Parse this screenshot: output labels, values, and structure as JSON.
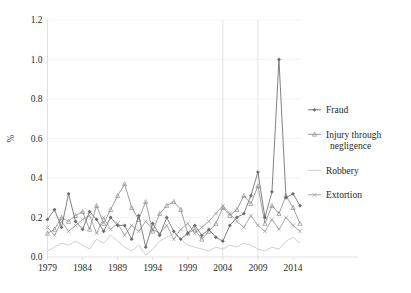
{
  "chart_data": {
    "type": "line",
    "title": "",
    "xlabel": "",
    "ylabel": "%",
    "xlim": [
      1979,
      2015
    ],
    "ylim": [
      0.0,
      1.2
    ],
    "grid": true,
    "grid_axis": "y-horizontal-faint-plus-two-vertical",
    "legend_position": "right",
    "y_ticks": [
      "0.0",
      "0.2",
      "0.4",
      "0.6",
      "0.8",
      "1.0",
      "1.2"
    ],
    "y_tick_values": [
      0.0,
      0.2,
      0.4,
      0.6,
      0.8,
      1.0,
      1.2
    ],
    "x_ticks": [
      "1979",
      "1984",
      "1989",
      "1994",
      "1999",
      "2004",
      "2009",
      "2014"
    ],
    "x_tick_values": [
      1979,
      1984,
      1989,
      1994,
      1999,
      2004,
      2009,
      2014
    ],
    "x": [
      1979,
      1980,
      1981,
      1982,
      1983,
      1984,
      1985,
      1986,
      1987,
      1988,
      1989,
      1990,
      1991,
      1992,
      1993,
      1994,
      1995,
      1996,
      1997,
      1998,
      1999,
      2000,
      2001,
      2002,
      2003,
      2004,
      2005,
      2006,
      2007,
      2008,
      2009,
      2010,
      2011,
      2012,
      2013,
      2014,
      2015
    ],
    "series": [
      {
        "name": "Fraud",
        "color": "#6b6b6b",
        "marker": "diamond",
        "values": [
          0.19,
          0.24,
          0.15,
          0.32,
          0.18,
          0.14,
          0.23,
          0.19,
          0.13,
          0.2,
          0.16,
          0.16,
          0.09,
          0.21,
          0.05,
          0.17,
          0.11,
          0.2,
          0.13,
          0.09,
          0.12,
          0.16,
          0.11,
          0.14,
          0.1,
          0.08,
          0.16,
          0.2,
          0.22,
          0.31,
          0.43,
          0.2,
          0.33,
          1.0,
          0.3,
          0.32,
          0.26
        ]
      },
      {
        "name": "Injury through negligence",
        "color": "#8f8f8f",
        "marker": "triangle",
        "values": [
          0.12,
          0.14,
          0.2,
          0.18,
          0.21,
          0.23,
          0.14,
          0.26,
          0.17,
          0.24,
          0.31,
          0.37,
          0.25,
          0.19,
          0.28,
          0.13,
          0.22,
          0.26,
          0.28,
          0.24,
          0.12,
          0.14,
          0.09,
          0.13,
          0.17,
          0.25,
          0.21,
          0.24,
          0.31,
          0.27,
          0.36,
          0.17,
          0.26,
          0.22,
          0.31,
          0.25,
          0.17
        ]
      },
      {
        "name": "Robbery",
        "color": "#c6c6c6",
        "marker": "line",
        "values": [
          0.03,
          0.05,
          0.07,
          0.06,
          0.08,
          0.06,
          0.04,
          0.09,
          0.07,
          0.11,
          0.08,
          0.05,
          0.03,
          0.06,
          0.01,
          0.04,
          0.08,
          0.1,
          0.12,
          0.09,
          0.06,
          0.05,
          0.04,
          0.03,
          0.05,
          0.04,
          0.06,
          0.05,
          0.07,
          0.06,
          0.04,
          0.03,
          0.05,
          0.04,
          0.08,
          0.1,
          0.07
        ]
      },
      {
        "name": "Extortion",
        "color": "#9e9e9e",
        "marker": "cross",
        "values": [
          0.15,
          0.11,
          0.18,
          0.13,
          0.16,
          0.19,
          0.21,
          0.12,
          0.2,
          0.14,
          0.17,
          0.11,
          0.16,
          0.13,
          0.18,
          0.14,
          0.12,
          0.16,
          0.09,
          0.14,
          0.17,
          0.12,
          0.15,
          0.18,
          0.22,
          0.26,
          0.22,
          0.18,
          0.15,
          0.21,
          0.16,
          0.13,
          0.19,
          0.14,
          0.2,
          0.16,
          0.13
        ]
      }
    ],
    "vertical_rules": [
      2004,
      2009
    ]
  },
  "legend": {
    "items": [
      {
        "label": "Fraud"
      },
      {
        "label": "Injury through"
      },
      {
        "label": "negligence"
      },
      {
        "label": "Robbery"
      },
      {
        "label": "Extortion"
      }
    ]
  }
}
